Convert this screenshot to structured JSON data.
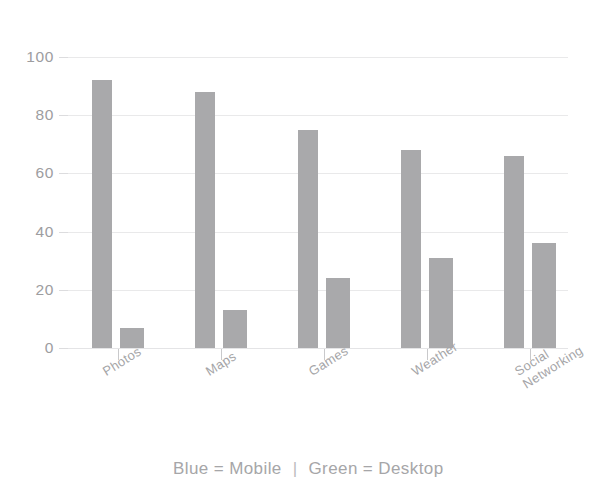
{
  "chart_data": {
    "type": "bar",
    "title": "",
    "subtitle": "",
    "xlabel": "",
    "ylabel": "",
    "categories": [
      "Photos",
      "Maps",
      "Games",
      "Weather",
      "Social\nNetworking"
    ],
    "series": [
      {
        "name": "Mobile",
        "color": "#a9a9ab",
        "values": [
          92,
          88,
          75,
          68,
          66
        ]
      },
      {
        "name": "Desktop",
        "color": "#a9a9ab",
        "values": [
          7,
          13,
          24,
          31,
          36
        ]
      }
    ],
    "ylim": [
      0,
      100
    ],
    "yticks": [
      0,
      20,
      40,
      60,
      80,
      100
    ],
    "ytick_labels": [
      "0",
      "20",
      "40",
      "60",
      "80",
      "100"
    ],
    "grid": true,
    "grid_color": "#e9e9ea",
    "legend_position": "bottom",
    "legend_text": {
      "left": "Blue = Mobile",
      "separator": "|",
      "right": "Green = Desktop"
    },
    "bar_color": "#a9a9ab",
    "axis_label_color": "#9d9d9f"
  }
}
